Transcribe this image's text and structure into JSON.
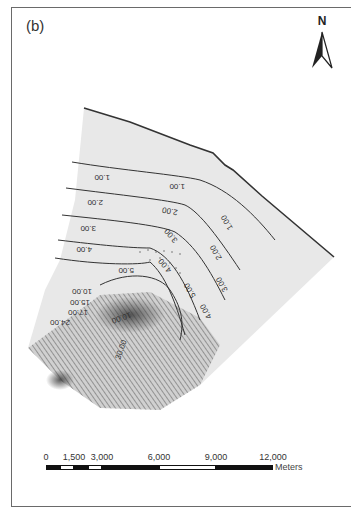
{
  "figure": {
    "panel_label": "(b)",
    "north_arrow": {
      "label": "N",
      "icon": "north-arrow-icon"
    }
  },
  "map": {
    "description": "Contour map of a wedge-shaped study area; contour labels rendered upside-down",
    "fill_color": "#e6e6e6",
    "line_color": "#333333",
    "contour_labels_upper": [
      "1.00",
      "1.00",
      "1.00",
      "2.00",
      "2.00",
      "2.00",
      "3.00",
      "3.00",
      "3.00",
      "4.00",
      "4.00",
      "4.00",
      "5.00",
      "5.00"
    ],
    "contour_labels_lower": [
      "10.00",
      "15.00",
      "17.00",
      "24.00",
      "30.00",
      "10.00"
    ]
  },
  "scale_bar": {
    "ticks": [
      "0",
      "1,500",
      "3,000",
      "6,000",
      "9,000",
      "12,000"
    ],
    "units": "Meters"
  }
}
